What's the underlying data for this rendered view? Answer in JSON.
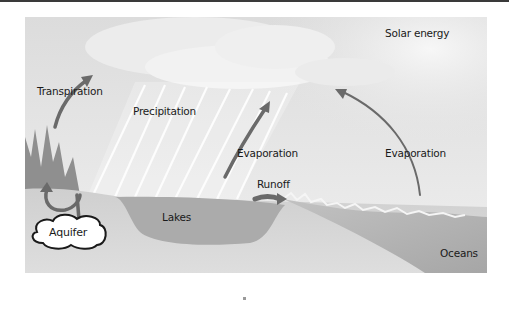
{
  "diagram": {
    "labels": {
      "solar_energy": "Solar energy",
      "transpiration": "Transpiration",
      "precipitation": "Precipitation",
      "evaporation_lake": "Evaporation",
      "evaporation_ocean": "Evaporation",
      "runoff": "Runoff",
      "lakes": "Lakes",
      "aquifer": "Aquifer",
      "oceans": "Oceans"
    },
    "colors": {
      "sky": "#e4e4e4",
      "cloud": "#f3f3f3",
      "ground": "#c9c9c9",
      "lake": "#a9a9a9",
      "ocean": "#b5b5b5",
      "trees": "#8f8f8f",
      "arrow": "#6a6a6a"
    }
  }
}
